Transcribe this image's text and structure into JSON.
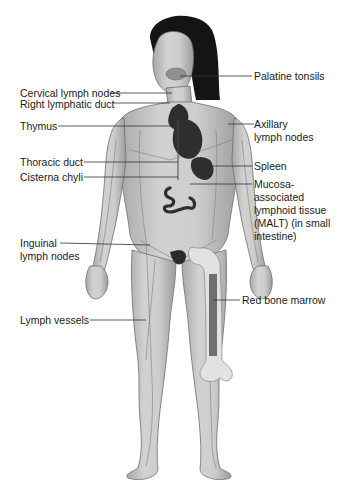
{
  "diagram": {
    "colors": {
      "skin": "#c9c9c9",
      "skin_shade": "#9a9a9a",
      "hair": "#141414",
      "organ": "#2e2e2e",
      "bone": "#e2e2e2",
      "marrow": "#6f6f6f",
      "vessel": "#7d7d7d",
      "leader_line": "#333333",
      "text": "#1a1a1a"
    },
    "labels_left": [
      {
        "id": "cervical",
        "text": "Cervical lymph nodes"
      },
      {
        "id": "right-lymphatic-duct",
        "text": "Right lymphatic duct"
      },
      {
        "id": "thymus",
        "text": "Thymus"
      },
      {
        "id": "thoracic-duct",
        "text": "Thoracic duct"
      },
      {
        "id": "cisterna-chyli",
        "text": "Cisterna chyli"
      },
      {
        "id": "inguinal",
        "line1": "Inguinal",
        "line2": "lymph nodes"
      },
      {
        "id": "lymph-vessels",
        "text": "Lymph vessels"
      }
    ],
    "labels_right": [
      {
        "id": "palatine-tonsils",
        "text": "Palatine tonsils"
      },
      {
        "id": "axillary",
        "line1": "Axillary",
        "line2": "lymph nodes"
      },
      {
        "id": "spleen",
        "text": "Spleen"
      },
      {
        "id": "malt",
        "lines": [
          "Mucosa-",
          "associated",
          "lymphoid tissue",
          "(MALT) (in small",
          "intestine)"
        ]
      },
      {
        "id": "red-bone-marrow",
        "text": "Red bone marrow"
      }
    ]
  }
}
